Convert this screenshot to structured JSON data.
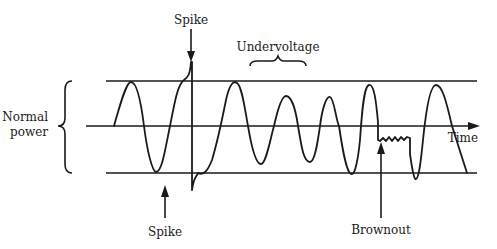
{
  "diagram": {
    "type": "power-disturbance-waveform",
    "labels": {
      "normal_power_line1": "Normal",
      "normal_power_line2": "power",
      "spike_top": "Spike",
      "spike_bottom": "Spike",
      "undervoltage": "Undervoltage",
      "time_axis": "Time",
      "brownout": "Brownout"
    },
    "reference_lines": [
      "upper-limit",
      "zero-axis",
      "lower-limit"
    ],
    "annotations": [
      {
        "name": "spike-top",
        "pointing": "down",
        "label_ref": "spike_top"
      },
      {
        "name": "spike-bottom",
        "pointing": "up",
        "label_ref": "spike_bottom"
      },
      {
        "name": "undervoltage",
        "marker": "brace",
        "label_ref": "undervoltage"
      },
      {
        "name": "brownout",
        "pointing": "up",
        "label_ref": "brownout"
      }
    ],
    "colors": {
      "ink": "#1a1a1a",
      "background": "#ffffff"
    }
  }
}
